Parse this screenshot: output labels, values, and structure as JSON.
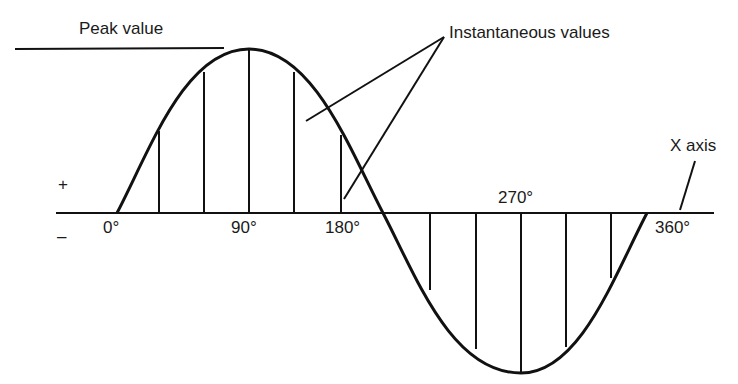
{
  "diagram": {
    "type": "sine-wave-ac-cycle",
    "labels": {
      "peak_value": "Peak value",
      "instantaneous_values": "Instantaneous values",
      "x_axis": "X axis",
      "plus": "+",
      "minus": "–",
      "deg_0": "0°",
      "deg_90": "90°",
      "deg_180": "180°",
      "deg_270": "270°",
      "deg_360": "360°"
    },
    "stroke_color": "#111111",
    "background": "#ffffff",
    "instantaneous_lines_deg": [
      30,
      60,
      90,
      120,
      150,
      210,
      240,
      270,
      300,
      330
    ]
  }
}
